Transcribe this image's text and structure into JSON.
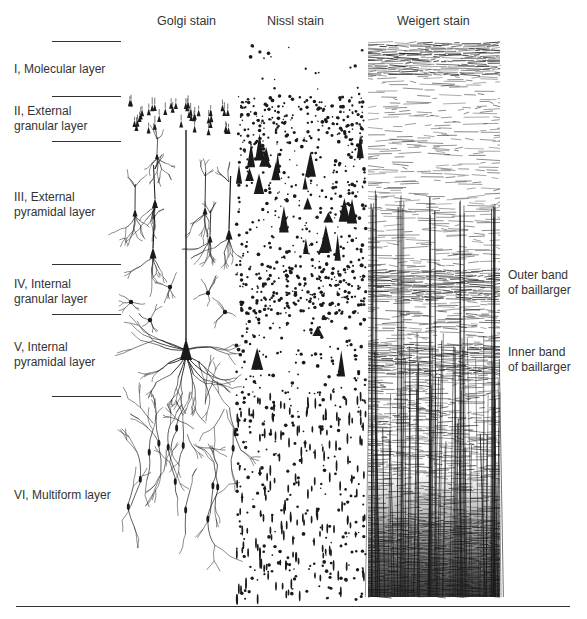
{
  "figure": {
    "columns": [
      {
        "id": "golgi",
        "title": "Golgi stain",
        "x": 157
      },
      {
        "id": "nissl",
        "title": "Nissl stain",
        "x": 267
      },
      {
        "id": "weigert",
        "title": "Weigert stain",
        "x": 397
      }
    ],
    "layers": [
      {
        "numeral": "I",
        "line1": "I, Molecular layer",
        "line2": "",
        "label_top": 62
      },
      {
        "numeral": "II",
        "line1": "II, External",
        "line2": "granular layer",
        "label_top": 104
      },
      {
        "numeral": "III",
        "line1": "III, External",
        "line2": "pyramidal layer",
        "label_top": 190
      },
      {
        "numeral": "IV",
        "line1": "IV, Internal",
        "line2": "granular layer",
        "label_top": 277
      },
      {
        "numeral": "V",
        "line1": "V, Internal",
        "line2": "pyramidal layer",
        "label_top": 340
      },
      {
        "numeral": "VI",
        "line1": "VI, Multiform layer",
        "line2": "",
        "label_top": 488
      }
    ],
    "layer_boundaries_y": [
      41,
      96,
      141,
      264,
      314,
      396
    ],
    "band_annotations": [
      {
        "line1": "Outer band",
        "line2": "of baillarger",
        "label_top": 268
      },
      {
        "line1": "Inner band",
        "line2": "of baillarger",
        "label_top": 345
      }
    ],
    "bottom_rule_y": 606,
    "colors": {
      "ink": "#1a1a1a",
      "text": "#333333",
      "background": "#ffffff"
    },
    "panels": {
      "golgi": {
        "x0": 123,
        "x1": 240,
        "y0": 95,
        "y1": 575
      },
      "nissl": {
        "x0": 236,
        "x1": 366,
        "y0": 45,
        "y1": 600
      },
      "weigert": {
        "x0": 368,
        "x1": 500,
        "y0": 43,
        "y1": 597
      }
    }
  }
}
